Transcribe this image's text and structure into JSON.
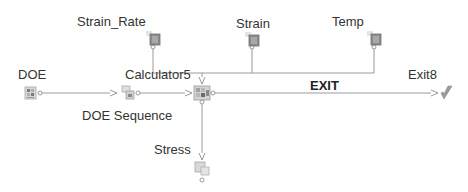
{
  "diagram": {
    "type": "workflow",
    "colors": {
      "line": "#9a9a9a",
      "icon_dark": "#7a7a7a",
      "icon_light": "#c8c8c8",
      "text": "#333333"
    },
    "nodes": [
      {
        "id": "doe",
        "label": "DOE",
        "icon": "doe-driver-icon"
      },
      {
        "id": "doe_sequence",
        "label": "DOE Sequence",
        "icon": "sequence-icon"
      },
      {
        "id": "calculator5",
        "label": "Calculator5",
        "icon": "calculator-icon"
      },
      {
        "id": "strain_rate",
        "label": "Strain_Rate",
        "icon": "parameter-input-icon"
      },
      {
        "id": "strain",
        "label": "Strain",
        "icon": "parameter-input-icon"
      },
      {
        "id": "temp",
        "label": "Temp",
        "icon": "parameter-input-icon"
      },
      {
        "id": "stress",
        "label": "Stress",
        "icon": "parameter-output-icon"
      },
      {
        "id": "exit8",
        "label": "Exit8",
        "icon": "exit-icon"
      }
    ],
    "edges": [
      {
        "from": "doe",
        "to": "doe_sequence"
      },
      {
        "from": "doe_sequence",
        "to": "calculator5"
      },
      {
        "from": "strain_rate",
        "to": "calculator5"
      },
      {
        "from": "strain",
        "to": "calculator5"
      },
      {
        "from": "temp",
        "to": "calculator5"
      },
      {
        "from": "calculator5",
        "to": "stress"
      },
      {
        "from": "calculator5",
        "to": "exit8",
        "label": "EXIT"
      }
    ]
  }
}
